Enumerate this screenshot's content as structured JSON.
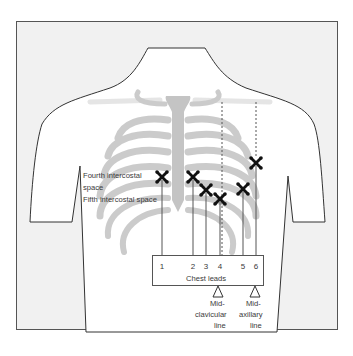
{
  "diagram": {
    "type": "anatomical-diagram",
    "colors": {
      "frame_bg": "#f1f1f1",
      "frame_border": "#555555",
      "torso_fill": "#ffffff",
      "bone_gray": "#c9c9c9",
      "marker": "#111111",
      "text": "#3a3a3a"
    },
    "labels": {
      "fourth_intercostal_line1": "Fourth intercostal",
      "fourth_intercostal_line2": "space",
      "fifth_intercostal": "Fifth intercostal space",
      "chest_leads": "Chest leads",
      "midclavicular_line1": "Mid-",
      "midclavicular_line2": "clavicular",
      "midclavicular_line3": "line",
      "midaxillary_line1": "Mid-",
      "midaxillary_line2": "axillary",
      "midaxillary_line3": "line"
    },
    "leads": [
      {
        "label": "1",
        "electrode_x": 162,
        "electrode_y": 177,
        "number_x": 157
      },
      {
        "label": "2",
        "electrode_x": 193,
        "electrode_y": 177,
        "number_x": 188
      },
      {
        "label": "3",
        "electrode_x": 206,
        "electrode_y": 190,
        "number_x": 201
      },
      {
        "label": "4",
        "electrode_x": 220,
        "electrode_y": 199,
        "number_x": 215
      },
      {
        "label": "5",
        "electrode_x": 243,
        "electrode_y": 189,
        "number_x": 238
      },
      {
        "label": "6",
        "electrode_x": 256,
        "electrode_y": 163,
        "number_x": 251
      }
    ],
    "reference_lines": [
      {
        "name": "mid-clavicular",
        "x": 222
      },
      {
        "name": "mid-axillary",
        "x": 256
      }
    ]
  }
}
